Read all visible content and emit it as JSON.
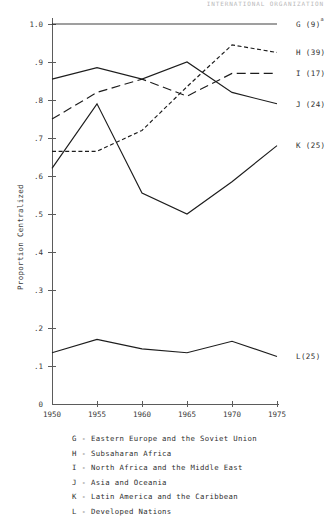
{
  "header": {
    "running_head": "INTERNATIONAL ORGANIZATION"
  },
  "chart_data": {
    "type": "line",
    "title": "",
    "xlabel": "",
    "ylabel": "Proportion Centralized",
    "x": [
      1950,
      1955,
      1960,
      1965,
      1970,
      1975
    ],
    "xtick_labels": [
      "1950",
      "1955",
      "1960",
      "1965",
      "1970",
      "1975"
    ],
    "origin_label": "0",
    "ytick_labels": [
      "1.0",
      ".9",
      ".8",
      ".7",
      ".6",
      ".5",
      ".4",
      ".3",
      ".2",
      ".1"
    ],
    "ytick_values": [
      1.0,
      0.9,
      0.8,
      0.7,
      0.6,
      0.5,
      0.4,
      0.3,
      0.2,
      0.1
    ],
    "ylim": [
      0.0,
      1.0
    ],
    "xlim": [
      1950,
      1975
    ],
    "grid": false,
    "legend_position": "right-of-axes",
    "series": [
      {
        "key": "G",
        "name": "G (9)",
        "label": "G (9)",
        "superscript": "a",
        "style": "solid",
        "values": [
          1.0,
          1.0,
          1.0,
          1.0,
          1.0,
          1.0
        ]
      },
      {
        "key": "H",
        "name": "H (39)",
        "label": "H (39)",
        "superscript": "",
        "style": "short-dash",
        "values": [
          0.665,
          0.665,
          0.72,
          0.835,
          0.945,
          0.925
        ]
      },
      {
        "key": "I",
        "name": "I (17)",
        "label": "I (17)",
        "superscript": "",
        "style": "long-dash",
        "values": [
          0.75,
          0.82,
          0.855,
          0.81,
          0.87,
          0.87
        ]
      },
      {
        "key": "J",
        "name": "J (24)",
        "label": "J (24)",
        "superscript": "",
        "style": "solid",
        "values": [
          0.855,
          0.885,
          0.855,
          0.9,
          0.82,
          0.79
        ]
      },
      {
        "key": "K",
        "name": "K (25)",
        "label": "K (25)",
        "superscript": "",
        "style": "solid",
        "values": [
          0.62,
          0.79,
          0.555,
          0.5,
          0.585,
          0.68
        ]
      },
      {
        "key": "L",
        "name": "L(25)",
        "label": "L(25)",
        "superscript": "",
        "style": "solid",
        "values": [
          0.135,
          0.17,
          0.145,
          0.135,
          0.165,
          0.125
        ]
      }
    ],
    "legend_entries": [
      "G - Eastern Europe and the Soviet Union",
      "H - Subsaharan Africa",
      "I - North Africa and the Middle East",
      "J - Asia and Oceania",
      "K - Latin America and the Caribbean",
      "L - Developed Nations"
    ]
  }
}
